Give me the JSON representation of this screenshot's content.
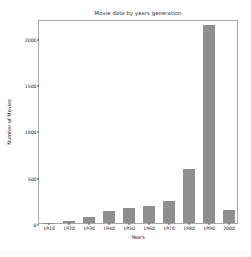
{
  "chart_data": {
    "type": "bar",
    "title": "Movie data by years generation",
    "xlabel": "Years",
    "ylabel": "Number of Movies",
    "categories": [
      "1910",
      "1920",
      "1930",
      "1940",
      "1950",
      "1960",
      "1970",
      "1980",
      "1990",
      "2000"
    ],
    "values": [
      5,
      25,
      70,
      125,
      160,
      180,
      235,
      585,
      2140,
      135
    ],
    "ylim": [
      0,
      2200
    ],
    "yticks": [
      0,
      500,
      1000,
      1500,
      2000
    ],
    "ytick_labels": [
      "0",
      "500",
      "1000",
      "1500",
      "2000"
    ],
    "grid": false,
    "legend": null,
    "bar_color": "#8f8f8f",
    "axes_color": "#aaaaaa",
    "background_color": "#ffffff",
    "figure_color": "#fbfbfb"
  }
}
